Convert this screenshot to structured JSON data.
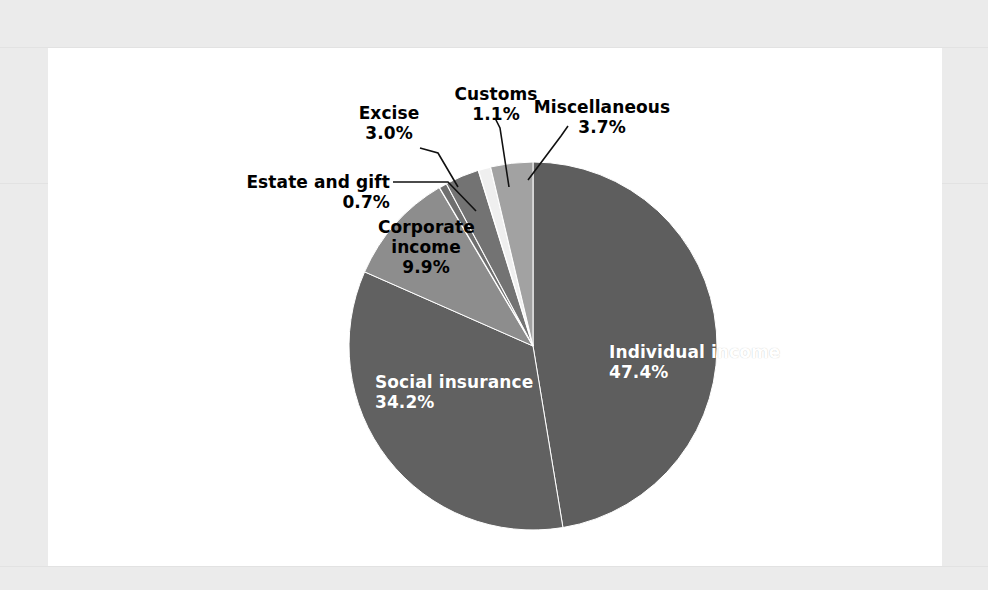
{
  "figure": {
    "background_color": "#ebebeb",
    "panel_color": "#ffffff"
  },
  "chart_data": {
    "type": "pie",
    "title": "",
    "subtitle": "",
    "xlabel": "",
    "ylabel": "",
    "legend_position": "none",
    "grid": false,
    "units": "percent",
    "start_angle_deg": 0,
    "direction": "clockwise",
    "categories": [
      "Individual income",
      "Social insurance",
      "Corporate income",
      "Estate and gift",
      "Excise",
      "Customs",
      "Miscellaneous"
    ],
    "values": [
      47.4,
      34.2,
      9.9,
      0.7,
      3.0,
      1.1,
      3.7
    ],
    "colors": [
      "#5e5e5e",
      "#616161",
      "#8d8d8d",
      "#6f6f6f",
      "#737373",
      "#efefef",
      "#a2a2a2"
    ],
    "slices": [
      {
        "label": "Individual income",
        "value_text": "47.4%",
        "value": 47.4,
        "color": "#5e5e5e",
        "label_placement": "inside",
        "text_color": "#ffffff"
      },
      {
        "label": "Social insurance",
        "value_text": "34.2%",
        "value": 34.2,
        "color": "#616161",
        "label_placement": "inside",
        "text_color": "#ffffff"
      },
      {
        "label": "Corporate income",
        "value_text": "9.9%",
        "value": 9.9,
        "color": "#8d8d8d",
        "label_placement": "inside",
        "text_color": "#000000"
      },
      {
        "label": "Estate and gift",
        "value_text": "0.7%",
        "value": 0.7,
        "color": "#6f6f6f",
        "label_placement": "outside",
        "text_color": "#000000",
        "leader_line": true
      },
      {
        "label": "Excise",
        "value_text": "3.0%",
        "value": 3.0,
        "color": "#737373",
        "label_placement": "outside",
        "text_color": "#000000",
        "leader_line": true
      },
      {
        "label": "Customs",
        "value_text": "1.1%",
        "value": 1.1,
        "color": "#efefef",
        "label_placement": "outside",
        "text_color": "#000000",
        "leader_line": true
      },
      {
        "label": "Miscellaneous",
        "value_text": "3.7%",
        "value": 3.7,
        "color": "#a2a2a2",
        "label_placement": "outside",
        "text_color": "#000000",
        "leader_line": true
      }
    ]
  },
  "labels": {
    "individual_income": {
      "name": "Individual income",
      "pct": "47.4%"
    },
    "social_insurance": {
      "name": "Social insurance",
      "pct": "34.2%"
    },
    "corporate_income": {
      "name_line1": "Corporate",
      "name_line2": "income",
      "pct": "9.9%"
    },
    "estate_and_gift": {
      "name": "Estate and gift",
      "pct": "0.7%"
    },
    "excise": {
      "name": "Excise",
      "pct": "3.0%"
    },
    "customs": {
      "name": "Customs",
      "pct": "1.1%"
    },
    "miscellaneous": {
      "name": "Miscellaneous",
      "pct": "3.7%"
    }
  }
}
